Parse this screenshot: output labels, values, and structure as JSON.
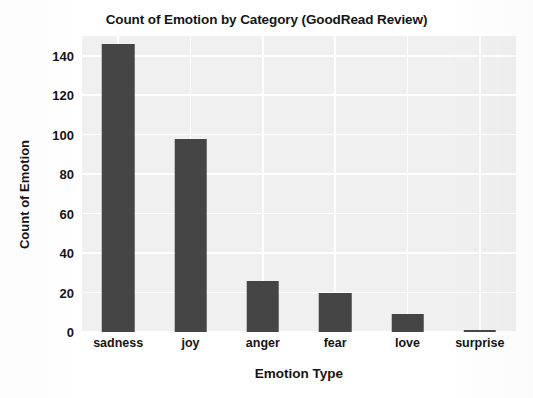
{
  "chart_data": {
    "type": "bar",
    "title": "Count of Emotion by Category (GoodRead Review)",
    "xlabel": "Emotion Type",
    "ylabel": "Count of Emotion",
    "categories": [
      "sadness",
      "joy",
      "anger",
      "fear",
      "love",
      "surprise"
    ],
    "values": [
      146,
      98,
      26,
      20,
      9,
      1
    ],
    "ylim": [
      0,
      150
    ],
    "yticks": [
      0,
      20,
      40,
      60,
      80,
      100,
      120,
      140
    ],
    "ytick_labels": [
      "0",
      "20",
      "40",
      "60",
      "80",
      "100",
      "120",
      "140"
    ],
    "grid": true,
    "grid_color": "#ffffff",
    "legend": "none",
    "bar_color": "#454545",
    "plot_background": "#f0f0f0",
    "figure_background": "#ffffff"
  }
}
